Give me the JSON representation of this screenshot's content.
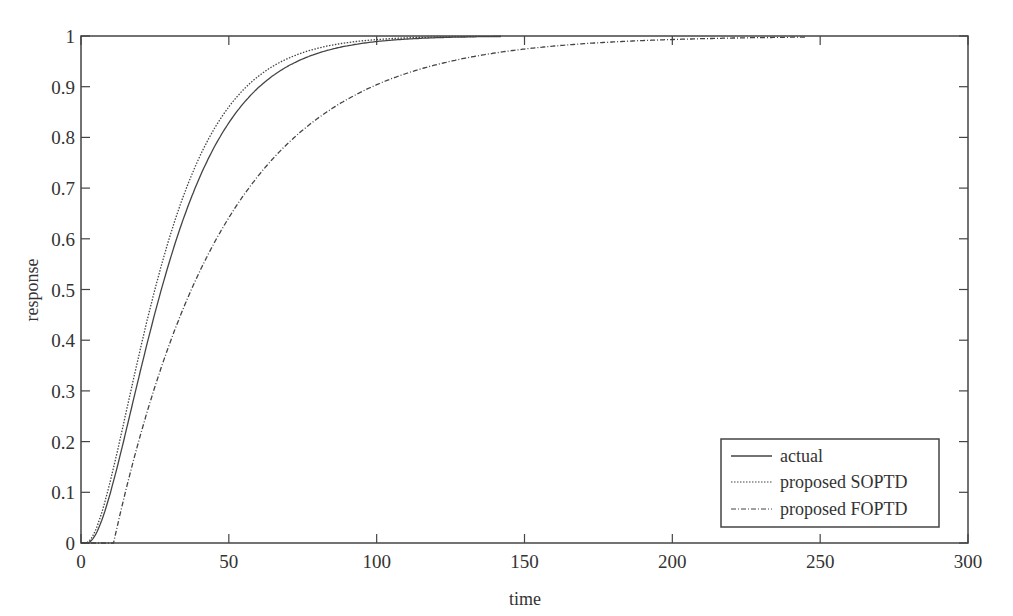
{
  "chart_data": {
    "type": "line",
    "title": "",
    "xlabel": "time",
    "ylabel": "response",
    "xlim": [
      0,
      300
    ],
    "ylim": [
      0,
      1
    ],
    "xticks": [
      0,
      50,
      100,
      150,
      200,
      250,
      300
    ],
    "yticks": [
      0,
      0.1,
      0.2,
      0.3,
      0.4,
      0.5,
      0.6,
      0.7,
      0.8,
      0.9,
      1
    ],
    "ytick_labels": [
      "0",
      "0.1",
      "0.2",
      "0.3",
      "0.4",
      "0.5",
      "0.6",
      "0.7",
      "0.8",
      "0.9",
      "1"
    ],
    "xtick_labels": [
      "0",
      "50",
      "100",
      "150",
      "200",
      "250",
      "300"
    ],
    "grid": false,
    "legend_position": "lower right",
    "series": [
      {
        "name": "actual",
        "style": "solid",
        "x": [
          0,
          2,
          5,
          10,
          14,
          20,
          26,
          30,
          40,
          50,
          60,
          70,
          80,
          90,
          100,
          110,
          120,
          130,
          142
        ],
        "y": [
          0,
          0,
          0.02,
          0.11,
          0.2,
          0.35,
          0.5,
          0.58,
          0.73,
          0.83,
          0.89,
          0.93,
          0.96,
          0.975,
          0.985,
          0.99,
          0.995,
          0.997,
          1.0
        ]
      },
      {
        "name": "proposed SOPTD",
        "style": "dotted",
        "x": [
          0,
          1.5,
          5,
          10,
          14,
          20,
          25,
          30,
          40,
          50,
          60,
          70,
          80,
          90,
          100,
          110,
          120,
          130,
          142
        ],
        "y": [
          0,
          0,
          0.03,
          0.13,
          0.22,
          0.38,
          0.5,
          0.6,
          0.75,
          0.85,
          0.91,
          0.95,
          0.97,
          0.98,
          0.99,
          0.995,
          0.997,
          0.999,
          1.0
        ]
      },
      {
        "name": "proposed FOPTD",
        "style": "dashdot",
        "x": [
          0,
          11,
          15,
          20,
          30,
          38.5,
          50,
          60,
          70,
          80,
          100,
          120,
          150,
          175,
          200,
          225,
          245
        ],
        "y": [
          0,
          0,
          0.1,
          0.21,
          0.39,
          0.5,
          0.64,
          0.72,
          0.78,
          0.83,
          0.91,
          0.95,
          0.97,
          0.985,
          0.993,
          0.997,
          1.0
        ]
      }
    ]
  },
  "legend": {
    "items": [
      "actual",
      "proposed SOPTD",
      "proposed FOPTD"
    ]
  },
  "colors": {
    "axis": "#444444",
    "line": "#444444"
  }
}
